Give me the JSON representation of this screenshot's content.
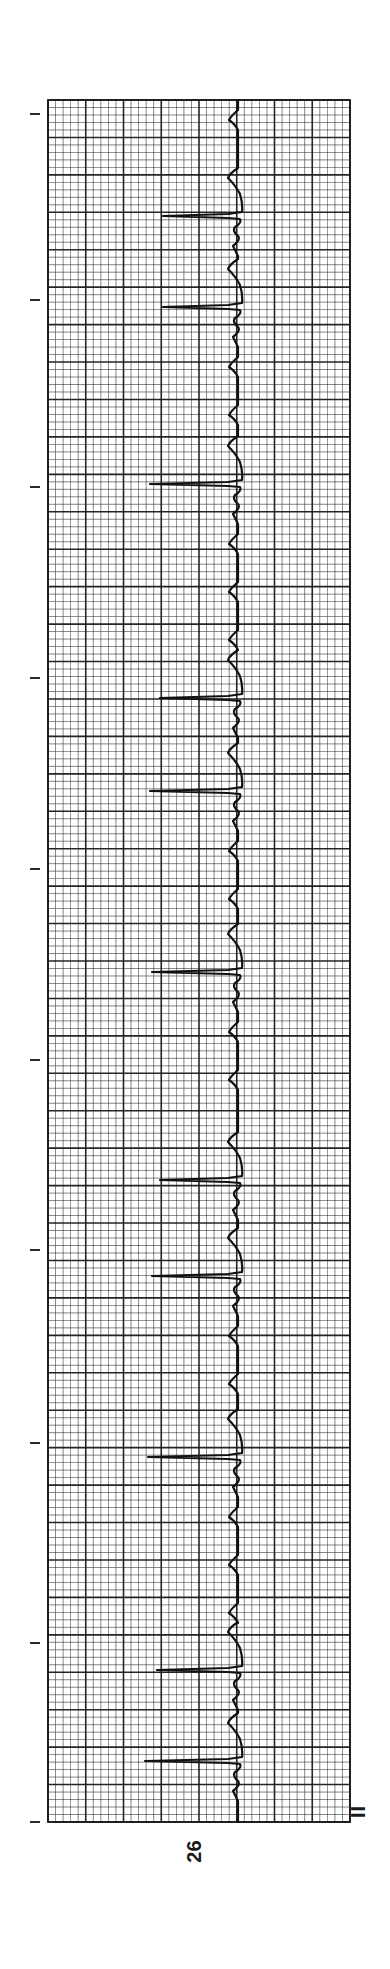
{
  "chart_data": {
    "type": "line",
    "title": "",
    "subtitle": "",
    "strip_number": "26",
    "lead": "II",
    "orientation": "rotated-90 (time runs top to bottom, positive amplitude to the left)",
    "xlabel": "",
    "ylabel": "",
    "grid": true,
    "grid_spec": {
      "minor_boxes_per_major": 5,
      "major_columns": 8,
      "major_rows": 46,
      "paper_color": "#ffffff",
      "line_color": "#1a1a1a"
    },
    "time_markers_px": [
      114,
      300,
      487,
      678,
      869,
      1060,
      1250,
      1443,
      1643,
      1822
    ],
    "beats": [
      {
        "index": 1,
        "r_wave_time_px": 216,
        "r_peak_amplitude_px": 75
      },
      {
        "index": 2,
        "r_wave_time_px": 307,
        "r_peak_amplitude_px": 75
      },
      {
        "index": 3,
        "r_wave_time_px": 484,
        "r_peak_amplitude_px": 88
      },
      {
        "index": 4,
        "r_wave_time_px": 698,
        "r_peak_amplitude_px": 78
      },
      {
        "index": 5,
        "r_wave_time_px": 791,
        "r_peak_amplitude_px": 88
      },
      {
        "index": 6,
        "r_wave_time_px": 972,
        "r_peak_amplitude_px": 86
      },
      {
        "index": 7,
        "r_wave_time_px": 1180,
        "r_peak_amplitude_px": 78
      },
      {
        "index": 8,
        "r_wave_time_px": 1276,
        "r_peak_amplitude_px": 86
      },
      {
        "index": 9,
        "r_wave_time_px": 1457,
        "r_peak_amplitude_px": 90
      },
      {
        "index": 10,
        "r_wave_time_px": 1670,
        "r_peak_amplitude_px": 81
      },
      {
        "index": 11,
        "r_wave_time_px": 1761,
        "r_peak_amplitude_px": 93
      }
    ],
    "rhythm_note": "Irregular RR intervals with grouped beats and small sawtooth waves between QRS complexes",
    "legend": []
  },
  "labels": {
    "strip_number": "26",
    "lead": "II"
  },
  "layout": {
    "grid_top": 100,
    "grid_bottom": 1822,
    "grid_left": 48,
    "grid_right": 350,
    "baseline_x": 238,
    "tick_x1": 30,
    "tick_x2": 40
  }
}
